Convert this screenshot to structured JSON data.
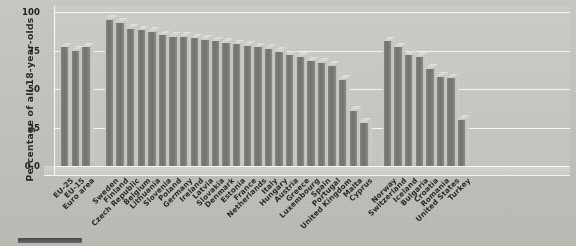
{
  "chart_data": {
    "type": "bar",
    "title": "",
    "xlabel": "",
    "ylabel": "Percentage of all 18-year-olds",
    "ylim": [
      0,
      100
    ],
    "ytick_labels": [
      "0.0",
      "25",
      "50",
      "75",
      "100"
    ],
    "ytick_values": [
      0,
      25,
      50,
      75,
      100
    ],
    "grid": true,
    "legend": "none",
    "style": "3d-bar",
    "groups": [
      {
        "name": "EU aggregates",
        "categories": [
          "EU-25",
          "EU-15",
          "Euro area"
        ],
        "values": [
          77,
          75,
          77
        ]
      },
      {
        "name": "EU member states",
        "categories": [
          "Sweden",
          "Finland",
          "Czech Republic",
          "Belgium",
          "Lithuania",
          "Slovenia",
          "Poland",
          "Germany",
          "Ireland",
          "Latvia",
          "Slovakia",
          "Denmark",
          "Estonia",
          "France",
          "Netherlands",
          "Italy",
          "Hungary",
          "Austria",
          "Greece",
          "Luxembourg",
          "Spain",
          "Portugal",
          "United Kingdom",
          "Malta",
          "Cyprus"
        ],
        "values": [
          95,
          93,
          89,
          88,
          87,
          85,
          84,
          84,
          83,
          82,
          81,
          80,
          79,
          78,
          77,
          76,
          74,
          72,
          71,
          68,
          67,
          65,
          56,
          36,
          28
        ]
      },
      {
        "name": "Non-EU countries",
        "categories": [
          "Norway",
          "Switzerland",
          "Iceland",
          "Bulgaria",
          "Croatia",
          "Romania",
          "United States",
          "Turkey"
        ],
        "values": [
          81,
          77,
          72,
          71,
          63,
          58,
          57,
          30
        ]
      }
    ],
    "categories": [
      "EU-25",
      "EU-15",
      "Euro area",
      "Sweden",
      "Finland",
      "Czech Republic",
      "Belgium",
      "Lithuania",
      "Slovenia",
      "Poland",
      "Germany",
      "Ireland",
      "Latvia",
      "Slovakia",
      "Denmark",
      "Estonia",
      "France",
      "Netherlands",
      "Italy",
      "Hungary",
      "Austria",
      "Greece",
      "Luxembourg",
      "Spain",
      "Portugal",
      "United Kingdom",
      "Malta",
      "Cyprus",
      "Norway",
      "Switzerland",
      "Iceland",
      "Bulgaria",
      "Croatia",
      "Romania",
      "United States",
      "Turkey"
    ],
    "values": [
      77,
      75,
      77,
      95,
      93,
      89,
      88,
      87,
      85,
      84,
      84,
      83,
      82,
      81,
      80,
      79,
      78,
      77,
      76,
      74,
      72,
      71,
      68,
      67,
      65,
      56,
      36,
      28,
      81,
      77,
      72,
      71,
      63,
      58,
      57,
      30
    ]
  },
  "colors": {
    "background": "#c8c7c1",
    "bar_front": "#7c7c78",
    "bar_top": "#dedcd6",
    "bar_side": "#cbcac4",
    "gridline": "#ffffff",
    "text": "#2a2a2a"
  }
}
